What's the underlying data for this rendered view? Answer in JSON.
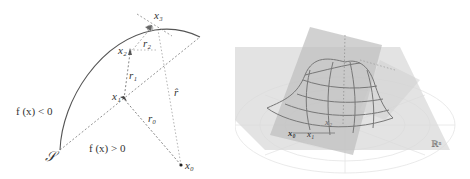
{
  "left_diagram": {
    "labels": {
      "x3": "x₃",
      "x2": "x₂",
      "x1": "x₁",
      "x0": "x₀",
      "r2": "r₂",
      "r1": "r₁",
      "r0": "r₀",
      "r_hat": "r̂",
      "f_negative": "f (x) < 0",
      "f_positive": "f (x) > 0",
      "surface": "𝒮"
    },
    "colors": {
      "curve": "#555555",
      "dashed_dark": "#666666",
      "dashed_light": "#aaaaaa",
      "text": "#333333"
    }
  },
  "right_diagram": {
    "labels": {
      "x0": "x₀",
      "x1": "x₁",
      "x2": "x₂",
      "space": "ℝⁿ"
    },
    "colors": {
      "plane_light": "#d8d8d8",
      "plane_dark": "#bdbdbd",
      "mesh": "#7a7a7a",
      "grid": "#e6e6e6"
    }
  }
}
